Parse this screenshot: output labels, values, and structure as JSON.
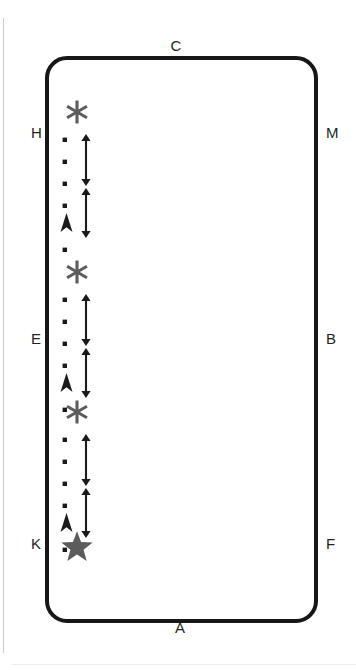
{
  "diagram": {
    "type": "annotated-rounded-rectangle-plate",
    "title": "",
    "background_color": "#ffffff",
    "plate": {
      "name": "rounded-rectangle-outline",
      "stroke_color": "#171717",
      "stroke_width_px": 4,
      "corner_radius_px": 22,
      "fill": "#ffffff",
      "x": 45,
      "y": 56,
      "width": 273,
      "height": 567
    },
    "rules": [
      {
        "name": "left-vertical-rule",
        "color": "#c9cacc",
        "x": 3,
        "y": 18,
        "width": 1,
        "height": 635
      },
      {
        "name": "bottom-horizontal-rule",
        "color": "#ededee",
        "x": 12,
        "y": 664,
        "width": 344,
        "height": 1
      }
    ],
    "edge_labels": [
      {
        "id": "C",
        "text": "C",
        "position": "top-center",
        "x": 176,
        "y": 38
      },
      {
        "id": "A",
        "text": "A",
        "position": "bottom-center",
        "x": 180,
        "y": 620
      },
      {
        "id": "H",
        "text": "H",
        "position": "left-upper",
        "x": 31,
        "y": 125
      },
      {
        "id": "M",
        "text": "M",
        "position": "right-upper",
        "x": 326,
        "y": 125
      },
      {
        "id": "E",
        "text": "E",
        "position": "left-middle",
        "x": 31,
        "y": 331
      },
      {
        "id": "B",
        "text": "B",
        "position": "right-middle",
        "x": 326,
        "y": 331
      },
      {
        "id": "K",
        "text": "K",
        "position": "left-lower",
        "x": 31,
        "y": 536
      },
      {
        "id": "F",
        "text": "F",
        "position": "right-lower",
        "x": 326,
        "y": 536
      }
    ],
    "symbol_color": "#5c5c5c",
    "marker_color": "#1a1a1a",
    "symbol_groups": [
      {
        "index": 1,
        "asterisk": {
          "name": "asterisk-marker",
          "glyph": "six-point-asterisk",
          "cx": 22,
          "cy": 22
        },
        "dots": [
          {
            "cx": 10,
            "cy": 50
          },
          {
            "cx": 10,
            "cy": 72
          },
          {
            "cx": 10,
            "cy": 94
          },
          {
            "cx": 10,
            "cy": 116
          },
          {
            "cx": 10,
            "cy": 160
          }
        ],
        "arrows": [
          {
            "name": "double-headed-arrow-upper",
            "x": 31,
            "y1": 44,
            "y2": 96
          },
          {
            "name": "double-headed-arrow-lower",
            "x": 31,
            "y1": 98,
            "y2": 148
          }
        ],
        "chevron": {
          "name": "up-chevron-marker",
          "cx": 11,
          "cy": 132
        }
      },
      {
        "index": 2,
        "asterisk": {
          "name": "asterisk-marker",
          "glyph": "six-point-asterisk",
          "cx": 22,
          "cy": 22
        },
        "dots": [
          {
            "cx": 10,
            "cy": 50
          },
          {
            "cx": 10,
            "cy": 72
          },
          {
            "cx": 10,
            "cy": 94
          },
          {
            "cx": 10,
            "cy": 116
          },
          {
            "cx": 10,
            "cy": 160
          }
        ],
        "arrows": [
          {
            "name": "double-headed-arrow-upper",
            "x": 31,
            "y1": 44,
            "y2": 96
          },
          {
            "name": "double-headed-arrow-lower",
            "x": 31,
            "y1": 98,
            "y2": 148
          }
        ],
        "chevron": {
          "name": "up-chevron-marker",
          "cx": 11,
          "cy": 132
        }
      },
      {
        "index": 3,
        "asterisk": {
          "name": "asterisk-marker",
          "glyph": "six-point-asterisk",
          "cx": 22,
          "cy": 22
        },
        "dots": [
          {
            "cx": 10,
            "cy": 50
          },
          {
            "cx": 10,
            "cy": 72
          },
          {
            "cx": 10,
            "cy": 94
          },
          {
            "cx": 10,
            "cy": 116
          },
          {
            "cx": 10,
            "cy": 160
          }
        ],
        "arrows": [
          {
            "name": "double-headed-arrow-upper",
            "x": 31,
            "y1": 44,
            "y2": 96
          },
          {
            "name": "double-headed-arrow-lower",
            "x": 31,
            "y1": 98,
            "y2": 148
          }
        ],
        "chevron": {
          "name": "up-chevron-marker",
          "cx": 11,
          "cy": 132
        }
      }
    ],
    "terminal_star": {
      "name": "filled-star-marker",
      "glyph": "five-point-star",
      "color": "#5c5c5c",
      "x": 60,
      "y": 530
    }
  }
}
